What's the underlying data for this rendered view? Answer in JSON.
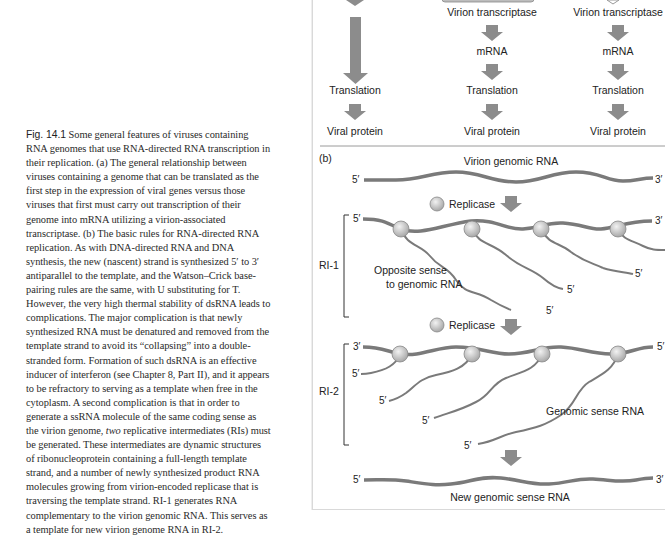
{
  "caption": {
    "label": "Fig. 14.1",
    "text_part1": " Some general features of viruses containing RNA genomes that use RNA-directed RNA transcription in their replication. (a) The general relationship between viruses containing a genome that can be translated as the first step in the expression of viral genes versus those viruses that first must carry out transcription of their genome into mRNA utilizing a virion-associated transcriptase. (b) The basic rules for RNA-directed RNA replication. As with DNA-directed RNA and DNA synthesis, the new (nascent) strand is synthesized 5′ to 3′ antiparallel to the template, and the Watson–Crick base-pairing rules are the same, with U substituting for T. However, the very high thermal stability of dsRNA leads to complications. The major complication is that newly synthesized RNA must be denatured and removed from the template strand to avoid its “collapsing” into a double-stranded form. Formation of such dsRNA is an effective inducer of interferon (see Chapter 8, Part II), and it appears to be refractory to serving as a template when free in the cytoplasm. A second complication is that in order to generate a ssRNA molecule of the same coding sense as the virion genome, ",
    "italic": "two",
    "text_part2": " replicative intermediates (RIs) must be generated. These intermediates are dynamic structures of ribonucleoprotein containing a full-length template strand, and a number of newly synthesized product RNA molecules growing from virion-encoded replicase that is traversing the template strand. RI-1 generates RNA complementary to the virion genomic RNA. This serves as a template for new virion genome RNA in RI-2."
  },
  "panel_a": {
    "columns": [
      {
        "steps": [
          "Translation",
          "Viral protein"
        ]
      },
      {
        "steps": [
          "Virion transcriptase",
          "mRNA",
          "Translation",
          "Viral protein"
        ]
      },
      {
        "steps": [
          "Virion transcriptase",
          "mRNA",
          "Translation",
          "Viral protein"
        ]
      }
    ]
  },
  "panel_b": {
    "label": "(b)",
    "genomic_title": "Virion genomic RNA",
    "replicase_label_1": "Replicase",
    "replicase_label_2": "Replicase",
    "ri1_label": "RI-1",
    "ri2_label": "RI-2",
    "opposite_sense_line1": "Opposite sense",
    "opposite_sense_line2": "to genomic RNA",
    "genomic_sense_label": "Genomic sense RNA",
    "new_genomic_label": "New genomic sense RNA",
    "five_prime": "5′",
    "three_prime": "3′"
  },
  "colors": {
    "strand": "#7a7a7a",
    "arrow_fill": "#8c8c8c",
    "replicase_fill": "#c8c8c8",
    "text": "#222222"
  }
}
